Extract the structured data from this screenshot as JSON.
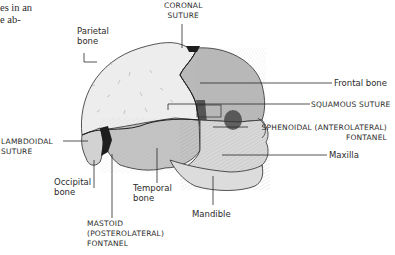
{
  "fragment_text": {
    "line1": "es in an",
    "line2": "e ab-"
  },
  "labels": {
    "parietal": {
      "line1": "Parietal",
      "line2": "bone"
    },
    "coronal": {
      "line1": "CORONAL",
      "line2": "SUTURE"
    },
    "frontal": "Frontal bone",
    "squamous": "SQUAMOUS SUTURE",
    "sphenoidal": {
      "line1": "SPHENOIDAL (ANTEROLATERAL)",
      "line2": "FONTANEL"
    },
    "maxilla": "Maxilla",
    "lambdoidal": {
      "line1": "LAMBDOIDAL",
      "line2": "SUTURE"
    },
    "occipital": {
      "line1": "Occipital",
      "line2": "bone"
    },
    "temporal": {
      "line1": "Temporal",
      "line2": "bone"
    },
    "mastoid": {
      "line1": "MASTOID",
      "line2": "(POSTEROLATERAL)",
      "line3": "FONTANEL"
    },
    "mandible": "Mandible"
  },
  "colors": {
    "parietal_fill": "#ececec",
    "frontal_fill": "#b9b9b9",
    "temporal_fill": "#c4c4c4",
    "occipital_fill": "#d2d2d2",
    "face_fill": "#d8d8d8",
    "fontanel_fill": "#1e1e1e",
    "line": "#2a2a2a"
  }
}
